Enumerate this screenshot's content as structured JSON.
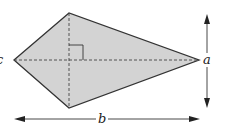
{
  "diagram": {
    "type": "kite",
    "labels": {
      "vertical_diagonal": "a",
      "horizontal_diagonal": "b",
      "left_edge_partial": "c"
    },
    "colors": {
      "fill": "#d3d3d3",
      "stroke": "#333333",
      "dashed": "#444444"
    },
    "vertices": {
      "left": [
        14,
        60
      ],
      "top": [
        69,
        13
      ],
      "right": [
        199,
        60
      ],
      "bottom": [
        69,
        108
      ]
    }
  }
}
